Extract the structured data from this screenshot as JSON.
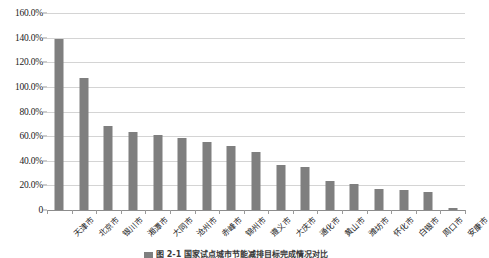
{
  "chart_data": {
    "type": "bar",
    "title": "",
    "xlabel": "",
    "ylabel": "",
    "ylim": [
      0,
      1.6
    ],
    "grid": true,
    "legend": "none",
    "ytick_labels": [
      "160.0%",
      "140.0%",
      "120.0%",
      "100.0%",
      "80.0%",
      "60.0%",
      "40.0%",
      "20.0%",
      "0"
    ],
    "ytick_values": [
      1.6,
      1.4,
      1.2,
      1.0,
      0.8,
      0.6,
      0.4,
      0.2,
      0
    ],
    "categories": [
      "天津市",
      "北京市",
      "银川市",
      "湘潭市",
      "大同市",
      "沧州市",
      "赤峰市",
      "锦州市",
      "遵义市",
      "大庆市",
      "通化市",
      "黄山市",
      "潍坊市",
      "怀化市",
      "白银市",
      "周口市",
      "安康市"
    ],
    "values": [
      1.385,
      1.073,
      0.682,
      0.633,
      0.608,
      0.585,
      0.553,
      0.522,
      0.468,
      0.362,
      0.352,
      0.233,
      0.208,
      0.168,
      0.16,
      0.148,
      0.02
    ],
    "value_labels": [
      "138.5%",
      "107.3%",
      "68.2%",
      "63.3%",
      "60.8%",
      "58.5%",
      "55.3%",
      "52.2%",
      "46.8%",
      "36.2%",
      "35.2%",
      "23.3%",
      "20.8%",
      "16.8%",
      "16.0%",
      "14.8%",
      "2.0%"
    ],
    "bar_color": "#7f7f7f",
    "gridline_color": "#d4d4d4",
    "background_color": "#ffffff"
  },
  "caption": {
    "text": "图 2-1   国家试点城市节能减排目标完成情况对比"
  }
}
